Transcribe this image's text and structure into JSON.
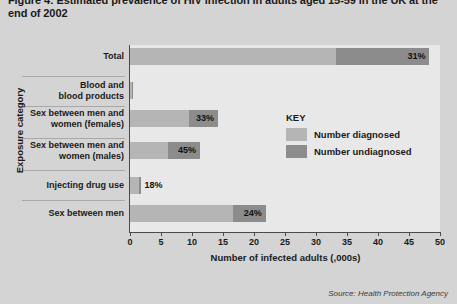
{
  "chart_data": {
    "type": "bar",
    "orientation": "horizontal",
    "title": "Figure 4: Estimated prevalence of HIV infection in adults aged 15-59 in the UK at the end of 2002",
    "xlabel": "Number of infected adults (,000s)",
    "ylabel": "Exposure category",
    "xlim": [
      0,
      50
    ],
    "xticks": [
      0,
      5,
      10,
      15,
      20,
      25,
      30,
      35,
      40,
      45,
      50
    ],
    "grid": false,
    "legend_position": "inside-right",
    "legend_title": "KEY",
    "categories": [
      "Total",
      "Blood and blood products",
      "Sex between men and women (females)",
      "Sex between men and women (males)",
      "Injecting drug use",
      "Sex between men"
    ],
    "series": [
      {
        "name": "Number diagnosed",
        "color": "#b5b5b5",
        "values": [
          33.3,
          0.25,
          9.5,
          6.2,
          1.4,
          16.6
        ]
      },
      {
        "name": "Number undiagnosed",
        "color": "#8c8c8c",
        "values": [
          15.0,
          0.12,
          4.7,
          5.1,
          0.3,
          5.3
        ]
      }
    ],
    "data_labels": [
      "31%",
      "",
      "33%",
      "45%",
      "18%",
      "24%"
    ],
    "totals": [
      48.3,
      0.37,
      14.2,
      11.3,
      1.7,
      21.9
    ],
    "source": "Source: Health Protection Agency"
  },
  "rows": [
    {
      "label": "Total",
      "label_lines": [
        "Total"
      ],
      "diagnosed": 33.3,
      "undiagnosed": 15.0,
      "value_label": "31%",
      "value_inside": true
    },
    {
      "label": "Blood and blood products",
      "label_lines": [
        "Blood and",
        "blood products"
      ],
      "diagnosed": 0.25,
      "undiagnosed": 0.12,
      "value_label": "",
      "value_inside": false
    },
    {
      "label": "Sex between men and women (females)",
      "label_lines": [
        "Sex between men and",
        "women (females)"
      ],
      "diagnosed": 9.5,
      "undiagnosed": 4.7,
      "value_label": "33%",
      "value_inside": true
    },
    {
      "label": "Sex between men and women (males)",
      "label_lines": [
        "Sex between men and",
        "women (males)"
      ],
      "diagnosed": 6.2,
      "undiagnosed": 5.1,
      "value_label": "45%",
      "value_inside": true
    },
    {
      "label": "Injecting drug use",
      "label_lines": [
        "Injecting drug use"
      ],
      "diagnosed": 1.4,
      "undiagnosed": 0.3,
      "value_label": "18%",
      "value_inside": false
    },
    {
      "label": "Sex between men",
      "label_lines": [
        "Sex between men"
      ],
      "diagnosed": 16.6,
      "undiagnosed": 5.3,
      "value_label": "24%",
      "value_inside": true
    }
  ],
  "legend": {
    "title": "KEY",
    "items": [
      {
        "label": "Number diagnosed",
        "color": "#b5b5b5"
      },
      {
        "label": "Number undiagnosed",
        "color": "#8c8c8c"
      }
    ]
  },
  "axes": {
    "x_title": "Number of infected adults (,000s)",
    "y_title": "Exposure category",
    "x_ticks": [
      "0",
      "5",
      "10",
      "15",
      "20",
      "25",
      "30",
      "35",
      "40",
      "45",
      "50"
    ]
  },
  "source": "Source: Health Protection Agency"
}
